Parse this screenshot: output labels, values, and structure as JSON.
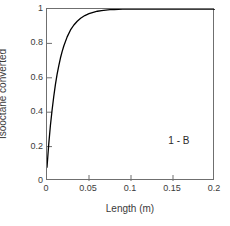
{
  "chart_data": {
    "type": "line",
    "title": "",
    "subtitle": "",
    "xlabel": "Length (m)",
    "ylabel": "Isooctane converted",
    "xlim": [
      0,
      0.2
    ],
    "ylim": [
      0,
      1
    ],
    "xticks": [
      "0",
      "0.05",
      "0.1",
      "0.15",
      "0.2"
    ],
    "xtick_values": [
      0,
      0.05,
      0.1,
      0.15,
      0.2
    ],
    "yticks": [
      "0",
      "0.2",
      "0.4",
      "0.6",
      "0.8",
      "1"
    ],
    "ytick_values": [
      0,
      0.2,
      0.4,
      0.6,
      0.8,
      1
    ],
    "grid": false,
    "legend": false,
    "legend_position": "none",
    "line_color": "#000000",
    "line_width": 1.3,
    "axis_color": "#6f6f6f",
    "background_color": "#ffffff",
    "series": [
      {
        "name": "Isooctane conversion",
        "x": [
          0,
          0.002,
          0.004,
          0.006,
          0.008,
          0.01,
          0.012,
          0.014,
          0.016,
          0.018,
          0.02,
          0.024,
          0.028,
          0.032,
          0.036,
          0.04,
          0.045,
          0.05,
          0.055,
          0.06,
          0.065,
          0.07,
          0.075,
          0.08,
          0.09,
          0.1,
          0.12,
          0.14,
          0.16,
          0.18,
          0.2
        ],
        "values": [
          0.08,
          0.21,
          0.32,
          0.41,
          0.49,
          0.56,
          0.62,
          0.67,
          0.715,
          0.752,
          0.785,
          0.838,
          0.878,
          0.907,
          0.929,
          0.946,
          0.962,
          0.973,
          0.981,
          0.987,
          0.991,
          0.994,
          0.996,
          0.997,
          0.999,
          1.0,
          1.0,
          1.0,
          1.0,
          1.0,
          1.0
        ]
      }
    ],
    "annotations": [
      {
        "text": "1 - B",
        "x": 0.157,
        "y": 0.238
      }
    ]
  }
}
